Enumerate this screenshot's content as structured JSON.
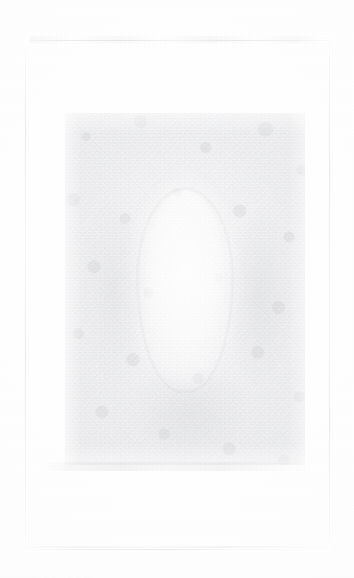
{
  "document": {
    "kind": "faded-scanned-page",
    "page_width": 354,
    "page_height": 578,
    "background_color": "#fefefe",
    "paper_tone": "#fcfcfc",
    "ink_tone": "#78798a",
    "condition": "severely faded / low-contrast scan"
  },
  "border_frame": {
    "label": "ruled page border",
    "left": 25,
    "top": 40,
    "width": 305,
    "height": 510,
    "stroke_color": "#78798a",
    "opacity": "0.14",
    "style": "thin single rule, broken by fading"
  },
  "plate": {
    "label": "central image plate",
    "left": 65,
    "top": 113,
    "width": 240,
    "height": 352,
    "texture": "mottled photographic grain",
    "tone_color": "#96989f",
    "description": "rectangular grainy block occupying the middle of the page"
  },
  "plate_subject": {
    "label": "oval highlight",
    "shape": "vertical ellipse",
    "center_x_percent": 50,
    "top_percent": 22,
    "width": 78,
    "height": 185,
    "fill": "#ffffff",
    "description": "lighter oval form, portrait-like, centered in the plate"
  },
  "margin_note": {
    "label": "left margin inscription",
    "text": "",
    "orientation": "vertical",
    "legibility": "illegible",
    "color": "#60626e"
  },
  "marks": {
    "top_smudge": "faint horizontal streak along the upper border rule",
    "bottom_smudge": "faint horizontal streak at the lower plate edge",
    "lower_rule": "broken horizontal rule near the page foot",
    "corner_mark": ""
  }
}
